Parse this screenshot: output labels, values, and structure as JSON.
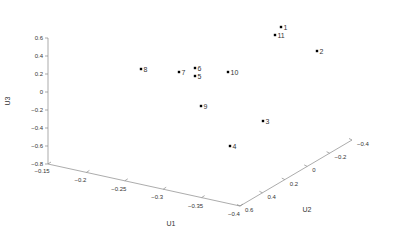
{
  "chart_data": {
    "type": "scatter3d",
    "title": "",
    "xlabel": "U1",
    "ylabel": "U2",
    "zlabel": "U3",
    "xlim": [
      -0.15,
      -0.4
    ],
    "ylim": [
      0.6,
      -0.4
    ],
    "zlim": [
      -0.8,
      0.6
    ],
    "x_ticks": [
      "-0.15",
      "-0.2",
      "-0.25",
      "-0.3",
      "-0.35",
      "-0.4"
    ],
    "y_ticks": [
      "0.6",
      "0.4",
      "0.2",
      "0",
      "-0.2",
      "-0.4"
    ],
    "z_ticks": [
      "0.6",
      "0.4",
      "0.2",
      "0",
      "-0.2",
      "-0.4",
      "-0.6",
      "-0.8"
    ],
    "grid": false,
    "legend": null,
    "points": [
      {
        "label": "1",
        "px": 281,
        "py": 27
      },
      {
        "label": "11",
        "px": 275,
        "py": 35
      },
      {
        "label": "2",
        "px": 317,
        "py": 51
      },
      {
        "label": "8",
        "px": 141,
        "py": 69
      },
      {
        "label": "7",
        "px": 179,
        "py": 72
      },
      {
        "label": "6",
        "px": 195,
        "py": 68
      },
      {
        "label": "5",
        "px": 195,
        "py": 76
      },
      {
        "label": "10",
        "px": 228,
        "py": 72
      },
      {
        "label": "9",
        "px": 201,
        "py": 106
      },
      {
        "label": "3",
        "px": 263,
        "py": 121
      },
      {
        "label": "4",
        "px": 230,
        "py": 146
      }
    ]
  },
  "colors": {
    "axis": "#888888",
    "text": "#333333",
    "marker": "#000000"
  }
}
